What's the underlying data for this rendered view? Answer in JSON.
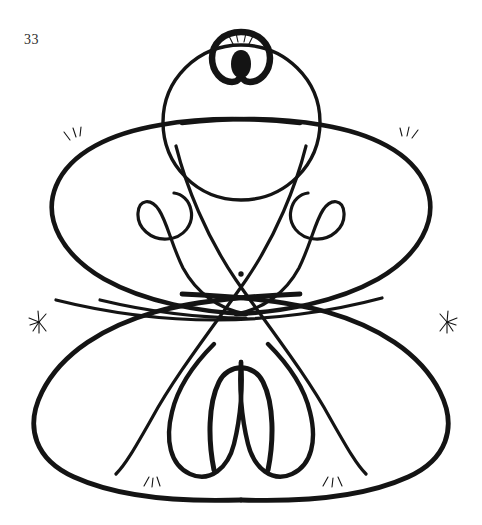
{
  "page": {
    "number": "33",
    "background_color": "#ffffff",
    "ink_color": "#141414",
    "width": 482,
    "height": 525
  },
  "figure": {
    "title": "",
    "type": "continuous-line-knot-drawing",
    "symmetry": "bilateral-vertical",
    "stroke_width_main": "3.2",
    "stroke_width_thick": "5.0",
    "center": {
      "x": 241,
      "y": 300
    },
    "center_dot": {
      "x": 241,
      "y": 274,
      "r": 2.6
    },
    "apex_bulb": {
      "cx": 241,
      "cy": 57,
      "rx": 28,
      "ry": 25
    },
    "apex_bulb_inner": {
      "cx": 241,
      "cy": 63,
      "rx": 10,
      "ry": 14
    },
    "top_circle": {
      "cx": 241,
      "cy": 122,
      "r": 78
    },
    "spark_marks": [
      {
        "name": "spark-top-center",
        "x": 241,
        "y": 44,
        "rays": 5,
        "size": 10,
        "orientation": -90
      },
      {
        "name": "spark-upper-left",
        "x": 73,
        "y": 136,
        "rays": 3,
        "size": 9,
        "orientation": -120
      },
      {
        "name": "spark-upper-right",
        "x": 410,
        "y": 134,
        "rays": 3,
        "size": 9,
        "orientation": -60
      },
      {
        "name": "spark-mid-left",
        "x": 39,
        "y": 322,
        "rays": 7,
        "size": 11,
        "orientation": 180
      },
      {
        "name": "spark-mid-right",
        "x": 447,
        "y": 322,
        "rays": 7,
        "size": 11,
        "orientation": 0
      },
      {
        "name": "spark-bottom-left",
        "x": 152,
        "y": 479,
        "rays": 4,
        "size": 9,
        "orientation": 90
      },
      {
        "name": "spark-bottom-right",
        "x": 333,
        "y": 478,
        "rays": 4,
        "size": 9,
        "orientation": 90
      }
    ],
    "spirals": [
      {
        "name": "spiral-left",
        "cx": 172,
        "cy": 218,
        "turn": "clockwise"
      },
      {
        "name": "spiral-right",
        "cx": 312,
        "cy": 218,
        "turn": "counter-clockwise"
      }
    ],
    "lobes": [
      {
        "name": "lobe-top",
        "cx": 241,
        "cy": 122
      },
      {
        "name": "lobe-upper-left",
        "cx": 128,
        "cy": 205
      },
      {
        "name": "lobe-upper-right",
        "cx": 356,
        "cy": 205
      },
      {
        "name": "lobe-lower-left",
        "cx": 118,
        "cy": 390
      },
      {
        "name": "lobe-lower-right",
        "cx": 366,
        "cy": 390
      },
      {
        "name": "loop-inner-left",
        "cx": 172,
        "cy": 420
      },
      {
        "name": "loop-inner-right",
        "cx": 312,
        "cy": 420
      },
      {
        "name": "loop-center",
        "cx": 241,
        "cy": 410
      }
    ]
  }
}
